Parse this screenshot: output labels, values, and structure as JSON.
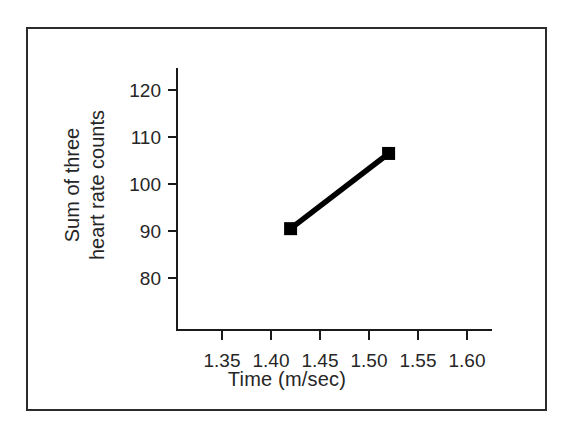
{
  "figure": {
    "background_color": "#ffffff",
    "frame_color": "#2b2b2b",
    "axis_color": "#1a1a1a",
    "series_color": "#000000"
  },
  "chart_data": {
    "type": "line",
    "title": "",
    "xlabel": "Time (m/sec)",
    "ylabel": "Sum of three heart rate counts",
    "ylabel_lines": [
      "Sum of three",
      "heart rate counts"
    ],
    "x": [
      1.42,
      1.52
    ],
    "y": [
      90.5,
      106.5
    ],
    "series": [
      {
        "name": "heart rate sum",
        "marker": "square",
        "x": [
          1.42,
          1.52
        ],
        "values": [
          90.5,
          106.5
        ]
      }
    ],
    "xlim": [
      1.325,
      1.61
    ],
    "ylim": [
      75.0,
      123.5
    ],
    "xticks": [
      1.35,
      1.4,
      1.45,
      1.5,
      1.55,
      1.6
    ],
    "xtick_labels": [
      "1.35",
      "1.40",
      "1.45",
      "1.50",
      "1.55",
      "1.60"
    ],
    "yticks": [
      80,
      90,
      100,
      110,
      120
    ],
    "ytick_labels": [
      "80",
      "90",
      "100",
      "110",
      "120"
    ],
    "grid": false,
    "legend": null
  }
}
